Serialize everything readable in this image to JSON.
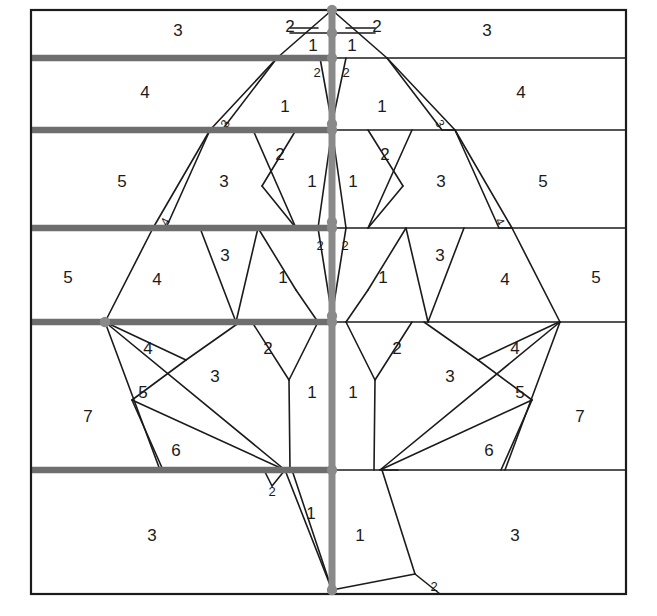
{
  "figure": {
    "type": "diagram",
    "width": 657,
    "height": 616,
    "background": "#ffffff",
    "colors": {
      "frame": "#1b1b1b",
      "thin_line": "#1b1b1b",
      "thick_band_line": "#6e6e6e",
      "axis": "#8a8a8a",
      "node": "#8a8a8a",
      "label_text": "#1b1b1b"
    },
    "frame": {
      "left": 31,
      "right": 626,
      "top": 10,
      "bottom": 594
    },
    "axis_x": 332,
    "band_boundaries_y": [
      10,
      58,
      130,
      228,
      322,
      470,
      594
    ],
    "thick_band_lines_y": [
      58,
      130,
      228,
      322,
      470
    ],
    "nodes": [
      {
        "x": 332,
        "y": 10
      },
      {
        "x": 332,
        "y": 33
      },
      {
        "x": 332,
        "y": 58
      },
      {
        "x": 332,
        "y": 124
      },
      {
        "x": 332,
        "y": 130
      },
      {
        "x": 332,
        "y": 222
      },
      {
        "x": 332,
        "y": 228
      },
      {
        "x": 332,
        "y": 316
      },
      {
        "x": 332,
        "y": 322
      },
      {
        "x": 105,
        "y": 322
      },
      {
        "x": 332,
        "y": 470
      },
      {
        "x": 332,
        "y": 590
      }
    ],
    "leader_labels": [
      {
        "text": "2",
        "x": 290,
        "y": 28,
        "side": "left"
      },
      {
        "text": "2",
        "x": 377,
        "y": 28,
        "side": "right"
      }
    ]
  },
  "region_labels": [
    {
      "id": "r1",
      "text": "3",
      "x": 178,
      "y": 32,
      "band": 1,
      "size": 17
    },
    {
      "id": "r2",
      "text": "3",
      "x": 487,
      "y": 32,
      "band": 1,
      "size": 17
    },
    {
      "id": "r3",
      "text": "1",
      "x": 313,
      "y": 47,
      "band": 1,
      "size": 17
    },
    {
      "id": "r4",
      "text": "1",
      "x": 352,
      "y": 47,
      "band": 1,
      "size": 17
    },
    {
      "id": "r5",
      "text": "4",
      "x": 145,
      "y": 94,
      "band": 2,
      "size": 17
    },
    {
      "id": "r6",
      "text": "4",
      "x": 521,
      "y": 94,
      "band": 2,
      "size": 17
    },
    {
      "id": "r7",
      "text": "1",
      "x": 285,
      "y": 108,
      "band": 2,
      "size": 17
    },
    {
      "id": "r8",
      "text": "1",
      "x": 382,
      "y": 108,
      "band": 2,
      "size": 17
    },
    {
      "id": "r9",
      "text": "2",
      "x": 317,
      "y": 74,
      "band": 2,
      "size": 13
    },
    {
      "id": "r10",
      "text": "2",
      "x": 346,
      "y": 74,
      "band": 2,
      "size": 13
    },
    {
      "id": "r11",
      "text": "3",
      "x": 226,
      "y": 124,
      "band": 2,
      "size": 12,
      "rotate": -62
    },
    {
      "id": "r12",
      "text": "3",
      "x": 439,
      "y": 124,
      "band": 2,
      "size": 12,
      "rotate": 62
    },
    {
      "id": "r13",
      "text": "5",
      "x": 122,
      "y": 183,
      "band": 3,
      "size": 17
    },
    {
      "id": "r14",
      "text": "5",
      "x": 543,
      "y": 183,
      "band": 3,
      "size": 17
    },
    {
      "id": "r15",
      "text": "3",
      "x": 224,
      "y": 183,
      "band": 3,
      "size": 17
    },
    {
      "id": "r16",
      "text": "3",
      "x": 441,
      "y": 183,
      "band": 3,
      "size": 17
    },
    {
      "id": "r17",
      "text": "2",
      "x": 280,
      "y": 156,
      "band": 3,
      "size": 17
    },
    {
      "id": "r18",
      "text": "2",
      "x": 385,
      "y": 156,
      "band": 3,
      "size": 17
    },
    {
      "id": "r19",
      "text": "1",
      "x": 312,
      "y": 183,
      "band": 3,
      "size": 17
    },
    {
      "id": "r20",
      "text": "1",
      "x": 353,
      "y": 183,
      "band": 3,
      "size": 17
    },
    {
      "id": "r21",
      "text": "4",
      "x": 166,
      "y": 222,
      "band": 3,
      "size": 12,
      "rotate": -62
    },
    {
      "id": "r22",
      "text": "4",
      "x": 499,
      "y": 222,
      "band": 3,
      "size": 12,
      "rotate": 62
    },
    {
      "id": "r23",
      "text": "5",
      "x": 68,
      "y": 279,
      "band": 4,
      "size": 17
    },
    {
      "id": "r24",
      "text": "5",
      "x": 596,
      "y": 279,
      "band": 4,
      "size": 17
    },
    {
      "id": "r25",
      "text": "4",
      "x": 157,
      "y": 281,
      "band": 4,
      "size": 17
    },
    {
      "id": "r26",
      "text": "4",
      "x": 505,
      "y": 281,
      "band": 4,
      "size": 17
    },
    {
      "id": "r27",
      "text": "3",
      "x": 225,
      "y": 257,
      "band": 4,
      "size": 17
    },
    {
      "id": "r28",
      "text": "3",
      "x": 440,
      "y": 257,
      "band": 4,
      "size": 17
    },
    {
      "id": "r29",
      "text": "1",
      "x": 283,
      "y": 279,
      "band": 4,
      "size": 17
    },
    {
      "id": "r30",
      "text": "1",
      "x": 383,
      "y": 279,
      "band": 4,
      "size": 17
    },
    {
      "id": "r31",
      "text": "2",
      "x": 320,
      "y": 247,
      "band": 4,
      "size": 13
    },
    {
      "id": "r32",
      "text": "2",
      "x": 345,
      "y": 247,
      "band": 4,
      "size": 13
    },
    {
      "id": "r33",
      "text": "7",
      "x": 88,
      "y": 418,
      "band": 5,
      "size": 17
    },
    {
      "id": "r34",
      "text": "7",
      "x": 580,
      "y": 418,
      "band": 5,
      "size": 17
    },
    {
      "id": "r35",
      "text": "4",
      "x": 148,
      "y": 350,
      "band": 5,
      "size": 17
    },
    {
      "id": "r36",
      "text": "4",
      "x": 515,
      "y": 350,
      "band": 5,
      "size": 17
    },
    {
      "id": "r37",
      "text": "5",
      "x": 143,
      "y": 394,
      "band": 5,
      "size": 17
    },
    {
      "id": "r38",
      "text": "5",
      "x": 520,
      "y": 394,
      "band": 5,
      "size": 17
    },
    {
      "id": "r39",
      "text": "6",
      "x": 176,
      "y": 452,
      "band": 5,
      "size": 17
    },
    {
      "id": "r40",
      "text": "6",
      "x": 489,
      "y": 452,
      "band": 5,
      "size": 17
    },
    {
      "id": "r41",
      "text": "3",
      "x": 215,
      "y": 378,
      "band": 5,
      "size": 17
    },
    {
      "id": "r42",
      "text": "3",
      "x": 450,
      "y": 378,
      "band": 5,
      "size": 17
    },
    {
      "id": "r43",
      "text": "2",
      "x": 268,
      "y": 350,
      "band": 5,
      "size": 17
    },
    {
      "id": "r44",
      "text": "2",
      "x": 397,
      "y": 350,
      "band": 5,
      "size": 17
    },
    {
      "id": "r45",
      "text": "1",
      "x": 312,
      "y": 394,
      "band": 5,
      "size": 17
    },
    {
      "id": "r46",
      "text": "1",
      "x": 353,
      "y": 394,
      "band": 5,
      "size": 17
    },
    {
      "id": "r47",
      "text": "3",
      "x": 152,
      "y": 537,
      "band": 6,
      "size": 17
    },
    {
      "id": "r48",
      "text": "3",
      "x": 515,
      "y": 537,
      "band": 6,
      "size": 17
    },
    {
      "id": "r49",
      "text": "1",
      "x": 311,
      "y": 515,
      "band": 6,
      "size": 17
    },
    {
      "id": "r50",
      "text": "1",
      "x": 360,
      "y": 537,
      "band": 6,
      "size": 17
    },
    {
      "id": "r51",
      "text": "2",
      "x": 272,
      "y": 493,
      "band": 6,
      "size": 13
    },
    {
      "id": "r52",
      "text": "2",
      "x": 434,
      "y": 588,
      "band": 6,
      "size": 13
    }
  ],
  "thin_edges": [
    [
      332,
      10,
      277,
      58
    ],
    [
      332,
      10,
      387,
      58
    ],
    [
      332,
      33,
      290,
      33
    ],
    [
      332,
      33,
      375,
      33
    ],
    [
      290,
      28,
      318,
      28
    ],
    [
      346,
      28,
      375,
      28
    ],
    [
      277,
      58,
      210,
      130
    ],
    [
      387,
      58,
      455,
      130
    ],
    [
      277,
      58,
      222,
      130
    ],
    [
      387,
      58,
      442,
      130
    ],
    [
      210,
      130,
      222,
      130
    ],
    [
      455,
      130,
      442,
      130
    ],
    [
      320,
      58,
      332,
      124
    ],
    [
      346,
      58,
      332,
      124
    ],
    [
      210,
      130,
      153,
      228
    ],
    [
      455,
      130,
      512,
      228
    ],
    [
      210,
      130,
      166,
      228
    ],
    [
      455,
      130,
      499,
      228
    ],
    [
      166,
      228,
      153,
      228
    ],
    [
      499,
      228,
      512,
      228
    ],
    [
      253,
      130,
      296,
      228
    ],
    [
      296,
      130,
      262,
      186
    ],
    [
      262,
      186,
      296,
      228
    ],
    [
      412,
      130,
      368,
      228
    ],
    [
      368,
      130,
      403,
      186
    ],
    [
      403,
      186,
      368,
      228
    ],
    [
      332,
      130,
      318,
      228
    ],
    [
      332,
      130,
      346,
      228
    ],
    [
      153,
      228,
      105,
      322
    ],
    [
      512,
      228,
      560,
      322
    ],
    [
      200,
      228,
      236,
      322
    ],
    [
      258,
      228,
      236,
      322
    ],
    [
      258,
      228,
      296,
      290
    ],
    [
      296,
      290,
      318,
      322
    ],
    [
      464,
      228,
      428,
      322
    ],
    [
      406,
      228,
      428,
      322
    ],
    [
      406,
      228,
      368,
      290
    ],
    [
      368,
      290,
      346,
      322
    ],
    [
      318,
      228,
      332,
      316
    ],
    [
      346,
      228,
      332,
      316
    ],
    [
      105,
      322,
      160,
      470
    ],
    [
      560,
      322,
      505,
      470
    ],
    [
      105,
      322,
      285,
      470
    ],
    [
      560,
      322,
      380,
      470
    ],
    [
      105,
      322,
      186,
      360
    ],
    [
      186,
      360,
      132,
      400
    ],
    [
      132,
      400,
      285,
      470
    ],
    [
      132,
      400,
      163,
      470
    ],
    [
      559,
      322,
      478,
      360
    ],
    [
      478,
      360,
      532,
      400
    ],
    [
      532,
      400,
      380,
      470
    ],
    [
      532,
      400,
      501,
      470
    ],
    [
      186,
      360,
      240,
      322
    ],
    [
      478,
      360,
      424,
      322
    ],
    [
      252,
      322,
      289,
      380
    ],
    [
      289,
      380,
      318,
      322
    ],
    [
      289,
      380,
      290,
      470
    ],
    [
      412,
      322,
      375,
      380
    ],
    [
      375,
      380,
      346,
      322
    ],
    [
      375,
      380,
      374,
      470
    ],
    [
      285,
      470,
      272,
      486
    ],
    [
      272,
      486,
      264,
      470
    ],
    [
      285,
      470,
      332,
      590
    ],
    [
      292,
      470,
      332,
      590
    ],
    [
      300,
      470,
      318,
      470
    ],
    [
      382,
      470,
      415,
      574
    ],
    [
      415,
      574,
      332,
      590
    ],
    [
      415,
      574,
      440,
      594
    ],
    [
      382,
      470,
      398,
      470
    ]
  ],
  "thick_lines": [
    {
      "x1": 31,
      "y1": 58,
      "x2": 332,
      "y2": 58
    },
    {
      "x1": 31,
      "y1": 130,
      "x2": 332,
      "y2": 130
    },
    {
      "x1": 31,
      "y1": 228,
      "x2": 332,
      "y2": 228
    },
    {
      "x1": 31,
      "y1": 322,
      "x2": 332,
      "y2": 322
    },
    {
      "x1": 31,
      "y1": 470,
      "x2": 332,
      "y2": 470
    }
  ],
  "thin_band_lines": [
    {
      "x1": 332,
      "y1": 58,
      "x2": 626,
      "y2": 58
    },
    {
      "x1": 332,
      "y1": 130,
      "x2": 626,
      "y2": 130
    },
    {
      "x1": 332,
      "y1": 228,
      "x2": 626,
      "y2": 228
    },
    {
      "x1": 332,
      "y1": 322,
      "x2": 626,
      "y2": 322
    },
    {
      "x1": 332,
      "y1": 470,
      "x2": 626,
      "y2": 470
    }
  ],
  "axis_line": {
    "x1": 332,
    "y1": 10,
    "x2": 332,
    "y2": 594
  }
}
